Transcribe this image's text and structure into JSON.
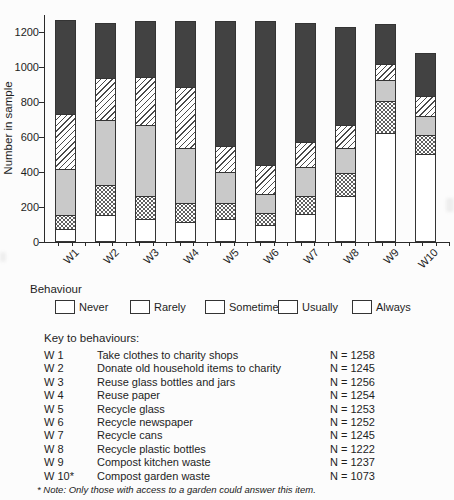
{
  "chart": {
    "ylabel": "Number in sample",
    "yticks": [
      0,
      200,
      400,
      600,
      800,
      1000,
      1200
    ]
  },
  "chart_data": {
    "type": "bar",
    "stacked": true,
    "title": "",
    "xlabel": "",
    "ylabel": "Number in sample",
    "ylim": [
      0,
      1300
    ],
    "grid": false,
    "legend_position": "below",
    "categories": [
      "W1",
      "W2",
      "W3",
      "W4",
      "W5",
      "W6",
      "W7",
      "W8",
      "W9",
      "W10"
    ],
    "series": [
      {
        "name": "Never",
        "values": [
          70,
          150,
          125,
          110,
          125,
          90,
          155,
          255,
          620,
          500
        ]
      },
      {
        "name": "Rarely",
        "values": [
          80,
          170,
          135,
          105,
          95,
          70,
          105,
          135,
          180,
          105
        ]
      },
      {
        "name": "Sometimes",
        "values": [
          265,
          375,
          405,
          315,
          175,
          110,
          165,
          145,
          125,
          112
        ]
      },
      {
        "name": "Usually",
        "values": [
          315,
          240,
          275,
          350,
          150,
          165,
          140,
          130,
          90,
          115
        ]
      },
      {
        "name": "Always",
        "values": [
          528,
          310,
          316,
          374,
          708,
          817,
          680,
          557,
          222,
          241
        ]
      }
    ],
    "totals": [
      1258,
      1245,
      1256,
      1254,
      1253,
      1252,
      1245,
      1222,
      1237,
      1073
    ]
  },
  "legend": {
    "title": "Behaviour",
    "items": [
      {
        "label": "Never",
        "pattern": "solid-white"
      },
      {
        "label": "Rarely",
        "pattern": "dots"
      },
      {
        "label": "Sometimes",
        "pattern": "solid-gray"
      },
      {
        "label": "Usually",
        "pattern": "diagonal-stripes"
      },
      {
        "label": "Always",
        "pattern": "solid-dark"
      }
    ]
  },
  "key": {
    "heading": "Key to behaviours:",
    "rows": [
      {
        "code": "W 1",
        "behaviour": "Take clothes to charity shops",
        "n": "N = 1258"
      },
      {
        "code": "W 2",
        "behaviour": "Donate old household items to charity",
        "n": "N = 1245"
      },
      {
        "code": "W 3",
        "behaviour": "Reuse glass bottles and jars",
        "n": "N = 1256"
      },
      {
        "code": "W 4",
        "behaviour": "Reuse paper",
        "n": "N = 1254"
      },
      {
        "code": "W 5",
        "behaviour": "Recycle glass",
        "n": "N = 1253"
      },
      {
        "code": "W 6",
        "behaviour": "Recycle newspaper",
        "n": "N = 1252"
      },
      {
        "code": "W 7",
        "behaviour": "Recycle cans",
        "n": "N = 1245"
      },
      {
        "code": "W 8",
        "behaviour": "Recycle plastic bottles",
        "n": "N = 1222"
      },
      {
        "code": "W 9",
        "behaviour": "Compost kitchen waste",
        "n": "N = 1237"
      },
      {
        "code": "W 10*",
        "behaviour": "Compost garden waste",
        "n": "N = 1073"
      }
    ],
    "footnote": "* Note: Only those with access to a garden could answer this item."
  },
  "colors": {
    "always_fill": "#424242",
    "sometimes_fill": "#c9c9c9",
    "bar_border": "#343434",
    "axis": "#2a2a2a",
    "background": "#fcfcfc"
  }
}
